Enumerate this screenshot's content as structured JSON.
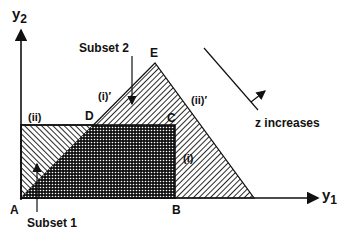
{
  "axes": {
    "y_axis_label": "y",
    "y_axis_sub": "2",
    "x_axis_label": "y",
    "x_axis_sub": "1"
  },
  "points": {
    "A": "A",
    "B": "B",
    "C": "C",
    "D": "D",
    "E": "E"
  },
  "constraints": {
    "i": "(i)",
    "ii": "(ii)",
    "i_prime": "(i)′",
    "ii_prime": "(ii)′"
  },
  "subsets": {
    "subset1": "Subset 1",
    "subset2": "Subset 2"
  },
  "objective": {
    "label": "z increases"
  },
  "colors": {
    "ink": "#111111",
    "background": "#ffffff"
  }
}
